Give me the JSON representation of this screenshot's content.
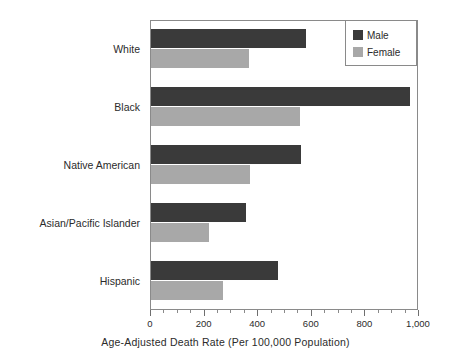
{
  "chart_data": {
    "type": "bar",
    "orientation": "horizontal",
    "title": "",
    "xlabel": "Age-Adjusted Death Rate (Per 100,000 Population)",
    "ylabel": "",
    "categories": [
      "White",
      "Black",
      "Native American",
      "Asian/Pacific Islander",
      "Hispanic"
    ],
    "series": [
      {
        "name": "Male",
        "color": "#3a3a3a",
        "values": [
          580,
          965,
          560,
          355,
          475
        ]
      },
      {
        "name": "Female",
        "color": "#a8a8a8",
        "values": [
          365,
          555,
          370,
          215,
          270
        ]
      }
    ],
    "xlim": [
      0,
      1000
    ],
    "xticks": [
      0,
      200,
      400,
      600,
      800,
      1000
    ],
    "xtick_labels": [
      "0",
      "200",
      "400",
      "600",
      "800",
      "1,000"
    ],
    "minor_tick_interval": 50,
    "grid": false,
    "legend_position": "top-right",
    "frame": true
  },
  "legend": {
    "entries": [
      {
        "label": "Male",
        "color": "#3a3a3a"
      },
      {
        "label": "Female",
        "color": "#a8a8a8"
      }
    ]
  },
  "axis": {
    "x_title": "Age-Adjusted Death Rate (Per 100,000 Population)"
  },
  "colors": {
    "male": "#3a3a3a",
    "female": "#a8a8a8",
    "frame": "#8a8a8a",
    "text": "#2b2b2b",
    "background": "#ffffff"
  }
}
